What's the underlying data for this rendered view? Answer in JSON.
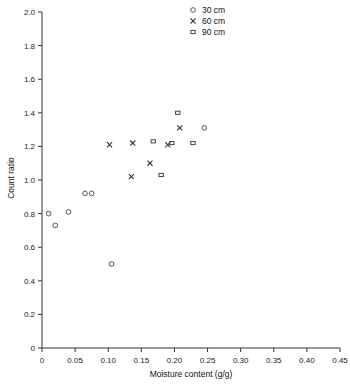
{
  "chart_data": {
    "type": "scatter",
    "title": "",
    "xlabel": "Moisture content (g/g)",
    "ylabel": "Count ratio",
    "xlim": [
      0,
      0.45
    ],
    "ylim": [
      0,
      2.0
    ],
    "xticks": [
      "0",
      "0.05",
      "0.10",
      "0.15",
      "0.20",
      "0.25",
      "0.30",
      "0.35",
      "0.40",
      "0.45"
    ],
    "xtick_values": [
      0,
      0.05,
      0.1,
      0.15,
      0.2,
      0.25,
      0.3,
      0.35,
      0.4,
      0.45
    ],
    "yticks": [
      "0",
      "0.2",
      "0.4",
      "0.6",
      "0.8",
      "1.0",
      "1.2",
      "1.4",
      "1.6",
      "1.8",
      "2.0"
    ],
    "ytick_values": [
      0,
      0.2,
      0.4,
      0.6,
      0.8,
      1.0,
      1.2,
      1.4,
      1.6,
      1.8,
      2.0
    ],
    "grid": false,
    "legend_position": "top-right",
    "series": [
      {
        "name": "30 cm",
        "marker": "circle",
        "color": "#444444",
        "points": [
          {
            "x": 0.01,
            "y": 0.8
          },
          {
            "x": 0.02,
            "y": 0.73
          },
          {
            "x": 0.04,
            "y": 0.81
          },
          {
            "x": 0.065,
            "y": 0.92
          },
          {
            "x": 0.075,
            "y": 0.92
          },
          {
            "x": 0.105,
            "y": 0.5
          },
          {
            "x": 0.245,
            "y": 1.31
          }
        ]
      },
      {
        "name": "60 cm",
        "marker": "x",
        "color": "#333333",
        "points": [
          {
            "x": 0.102,
            "y": 1.21
          },
          {
            "x": 0.137,
            "y": 1.22
          },
          {
            "x": 0.135,
            "y": 1.02
          },
          {
            "x": 0.163,
            "y": 1.1
          },
          {
            "x": 0.19,
            "y": 1.21
          },
          {
            "x": 0.208,
            "y": 1.31
          }
        ]
      },
      {
        "name": "90 cm",
        "marker": "square",
        "color": "#444444",
        "points": [
          {
            "x": 0.168,
            "y": 1.23
          },
          {
            "x": 0.196,
            "y": 1.22
          },
          {
            "x": 0.18,
            "y": 1.03
          },
          {
            "x": 0.228,
            "y": 1.22
          },
          {
            "x": 0.205,
            "y": 1.4
          }
        ]
      }
    ]
  },
  "legend": {
    "items": [
      {
        "label": "30 cm",
        "marker": "circle"
      },
      {
        "label": "60 cm",
        "marker": "x"
      },
      {
        "label": "90 cm",
        "marker": "square"
      }
    ]
  }
}
